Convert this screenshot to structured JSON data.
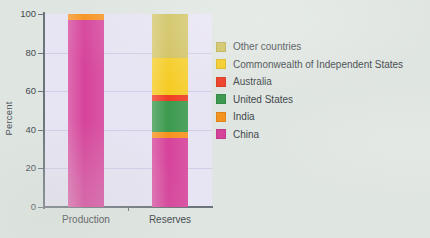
{
  "chart_data": {
    "type": "bar",
    "subtype": "stacked-bar-100",
    "title": "",
    "xlabel": "",
    "ylabel": "Percent",
    "categories": [
      "Production",
      "Reserves"
    ],
    "ylim": [
      0,
      100
    ],
    "yticks": [
      0,
      20,
      40,
      60,
      80,
      100
    ],
    "ytick_labels": [
      "0",
      "20",
      "40",
      "60",
      "80",
      "100"
    ],
    "grid": true,
    "grid_axis": "y",
    "legend_position": "right",
    "units": "percent",
    "series": [
      {
        "name": "China",
        "color": "#d6439b",
        "values": [
          97,
          36
        ]
      },
      {
        "name": "India",
        "color": "#f6921e",
        "values": [
          3,
          3
        ]
      },
      {
        "name": "United States",
        "color": "#3c9a4e",
        "values": [
          0,
          16
        ]
      },
      {
        "name": "Australia",
        "color": "#ee3d23",
        "values": [
          0,
          3
        ]
      },
      {
        "name": "Commonwealth of Independent States",
        "color": "#f5cb1f",
        "values": [
          0,
          19
        ]
      },
      {
        "name": "Other countries",
        "color": "#cfc05a",
        "values": [
          0,
          23
        ]
      }
    ],
    "legend_entries": [
      {
        "label": "Other countries",
        "color": "#cfc05a"
      },
      {
        "label": "Commonwealth of Independent States",
        "color": "#f5cb1f"
      },
      {
        "label": "Australia",
        "color": "#ee3d23"
      },
      {
        "label": "United States",
        "color": "#3c9a4e"
      },
      {
        "label": "India",
        "color": "#f6921e"
      },
      {
        "label": "China",
        "color": "#d6439b"
      }
    ],
    "plot_background": "#e7e4f3",
    "figure_background": "#dfe5e0"
  }
}
